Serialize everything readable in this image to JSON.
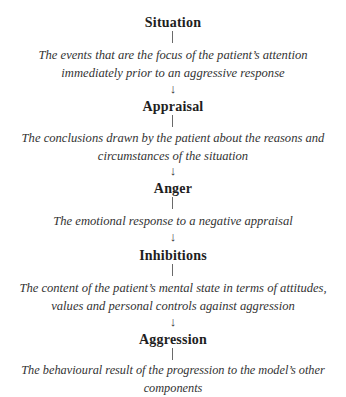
{
  "diagram": {
    "type": "flow",
    "direction": "vertical",
    "nodes": [
      {
        "title": "Situation",
        "description_lines": [
          "The events that are the focus of the patient’s attention",
          "immediately prior to an aggressive response"
        ]
      },
      {
        "title": "Appraisal",
        "description_lines": [
          "The conclusions drawn by the patient about the reasons and",
          "circumstances of the situation"
        ]
      },
      {
        "title": "Anger",
        "description_lines": [
          "The emotional response to a negative appraisal"
        ]
      },
      {
        "title": "Inhibitions",
        "description_lines": [
          "The content of the patient’s mental state in terms of attitudes,",
          "values and personal controls against aggression"
        ]
      },
      {
        "title": "Aggression",
        "description_lines": [
          "The behavioural result of the progression to the model’s other components"
        ]
      }
    ],
    "arrow_glyph": "↓",
    "colors": {
      "text": "#2a2a2a",
      "connector": "#6a6a6a",
      "background": "#ffffff"
    }
  }
}
